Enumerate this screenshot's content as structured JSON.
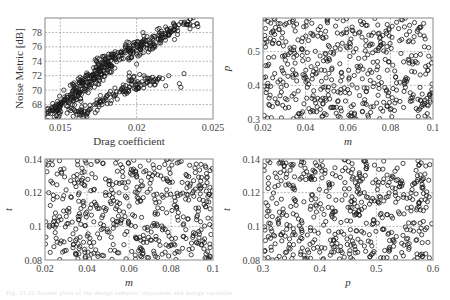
{
  "figure": {
    "caption": "Fig. 11.22 Scatter plots of the design samples: objectives and design variables"
  },
  "chart_data": [
    {
      "id": "noise-vs-drag",
      "type": "scatter",
      "title": "",
      "xlabel": "Drag coefficient",
      "ylabel": "Noise Metric [dB]",
      "xlabel_italic": false,
      "ylabel_italic": false,
      "xlim": [
        0.014,
        0.025
      ],
      "ylim": [
        66,
        80
      ],
      "xticks": [
        0.015,
        0.02,
        0.025
      ],
      "xtick_labels": [
        "0.015",
        "0.02",
        "0.025"
      ],
      "yticks": [
        68,
        70,
        72,
        74,
        76,
        78
      ],
      "ytick_labels": [
        "68",
        "70",
        "72",
        "74",
        "76",
        "78"
      ],
      "grid": true,
      "marker": "open-circle",
      "description": "Dense positively correlated band from (0.0145, 67) up to (0.0235, 79.5); secondary lower branch from (0.017, 67) to (0.023, 72)",
      "points": [
        [
          0.0145,
          67.2
        ],
        [
          0.0147,
          67.6
        ],
        [
          0.015,
          68.0
        ],
        [
          0.0152,
          68.4
        ],
        [
          0.0155,
          69.0
        ],
        [
          0.0158,
          69.5
        ],
        [
          0.016,
          70.0
        ],
        [
          0.0163,
          70.6
        ],
        [
          0.0165,
          71.0
        ],
        [
          0.0168,
          71.6
        ],
        [
          0.017,
          72.0
        ],
        [
          0.0173,
          72.6
        ],
        [
          0.0175,
          73.0
        ],
        [
          0.0178,
          73.5
        ],
        [
          0.018,
          74.0
        ],
        [
          0.0183,
          74.5
        ],
        [
          0.0186,
          75.0
        ],
        [
          0.019,
          75.4
        ],
        [
          0.0195,
          75.8
        ],
        [
          0.0198,
          76.2
        ],
        [
          0.0203,
          76.6
        ],
        [
          0.0206,
          76.8
        ],
        [
          0.021,
          77.3
        ],
        [
          0.0215,
          77.9
        ],
        [
          0.022,
          78.4
        ],
        [
          0.0225,
          78.8
        ],
        [
          0.0229,
          79.4
        ],
        [
          0.0235,
          79.8
        ],
        [
          0.016,
          67.0
        ],
        [
          0.0165,
          66.6
        ],
        [
          0.017,
          67.4
        ],
        [
          0.0175,
          68.0
        ],
        [
          0.018,
          68.6
        ],
        [
          0.0185,
          69.2
        ],
        [
          0.019,
          70.0
        ],
        [
          0.0195,
          70.4
        ],
        [
          0.0198,
          71.8
        ],
        [
          0.0203,
          70.7
        ],
        [
          0.0208,
          71.3
        ],
        [
          0.0213,
          71.2
        ],
        [
          0.0217,
          71.6
        ],
        [
          0.0219,
          70.6
        ],
        [
          0.0221,
          72.0
        ],
        [
          0.0228,
          70.9
        ],
        [
          0.0229,
          70.4
        ],
        [
          0.0231,
          72.3
        ],
        [
          0.02,
          73.6
        ],
        [
          0.0195,
          74.5
        ]
      ]
    },
    {
      "id": "p-vs-m",
      "type": "scatter",
      "xlabel": "m",
      "ylabel": "p",
      "xlabel_italic": true,
      "ylabel_italic": true,
      "xlim": [
        0.02,
        0.1
      ],
      "ylim": [
        0.3,
        0.6
      ],
      "xticks": [
        0.02,
        0.04,
        0.06,
        0.08,
        0.1
      ],
      "xtick_labels": [
        "0.02",
        "0.04",
        "0.06",
        "0.08",
        "0.1"
      ],
      "yticks": [
        0.3,
        0.4,
        0.5
      ],
      "ytick_labels": [
        "0.3",
        "0.4",
        "0.5"
      ],
      "grid": true,
      "marker": "open-circle",
      "description": "Approximately uniform random space-filling sample (~500 points) over the full m-p domain",
      "n_points": 500,
      "seed": 7
    },
    {
      "id": "t-vs-m",
      "type": "scatter",
      "xlabel": "m",
      "ylabel": "t",
      "xlabel_italic": true,
      "ylabel_italic": true,
      "xlim": [
        0.02,
        0.1
      ],
      "ylim": [
        0.08,
        0.14
      ],
      "xticks": [
        0.02,
        0.04,
        0.06,
        0.08,
        0.1
      ],
      "xtick_labels": [
        "0.02",
        "0.04",
        "0.06",
        "0.08",
        "0.1"
      ],
      "yticks": [
        0.08,
        0.1,
        0.12,
        0.14
      ],
      "ytick_labels": [
        "0.08",
        "0.1",
        "0.12",
        "0.14"
      ],
      "grid": true,
      "marker": "open-circle",
      "description": "Approximately uniform random space-filling sample (~500 points) over the full m-t domain",
      "n_points": 500,
      "seed": 13
    },
    {
      "id": "t-vs-p",
      "type": "scatter",
      "xlabel": "p",
      "ylabel": "t",
      "xlabel_italic": true,
      "ylabel_italic": true,
      "xlim": [
        0.3,
        0.6
      ],
      "ylim": [
        0.08,
        0.14
      ],
      "xticks": [
        0.3,
        0.4,
        0.5,
        0.6
      ],
      "xtick_labels": [
        "0.3",
        "0.4",
        "0.5",
        "0.6"
      ],
      "yticks": [
        0.08,
        0.1,
        0.12,
        0.14
      ],
      "ytick_labels": [
        "0.08",
        "0.1",
        "0.12",
        "0.14"
      ],
      "grid": true,
      "marker": "open-circle",
      "description": "Approximately uniform random space-filling sample (~500 points) over the full p-t domain",
      "n_points": 500,
      "seed": 29
    }
  ],
  "layout": {
    "panels": [
      {
        "chart": 0,
        "left": 45,
        "top": 18,
        "width": 168,
        "height": 101
      },
      {
        "chart": 1,
        "left": 263,
        "top": 18,
        "width": 170,
        "height": 101
      },
      {
        "chart": 2,
        "left": 45,
        "top": 159,
        "width": 168,
        "height": 101
      },
      {
        "chart": 3,
        "left": 263,
        "top": 159,
        "width": 170,
        "height": 101
      }
    ],
    "colors": {
      "frame": "#888888",
      "grid": "#9a9a9a",
      "marker": "#1a1a1a"
    }
  }
}
